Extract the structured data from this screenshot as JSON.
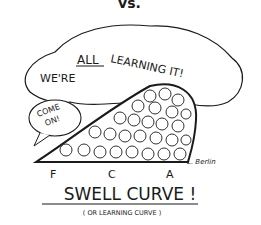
{
  "cartoon": {
    "top_fragment": "vs.",
    "bubble_text_1": "WE'RE",
    "bubble_text_all": "ALL",
    "bubble_text_2": "LEARNING IT!",
    "small_bubble_line1": "COME",
    "small_bubble_line2": "ON!",
    "grades": [
      "F",
      "C",
      "A"
    ],
    "title": "SWELL CURVE !",
    "subtitle": "( OR LEARNING CURVE )",
    "signature": "L. Berlin"
  }
}
